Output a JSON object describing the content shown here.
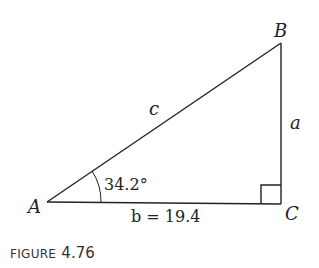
{
  "figure": {
    "vertices": {
      "A": "A",
      "B": "B",
      "C": "C"
    },
    "sides": {
      "hypotenuse": "c",
      "opposite": "a",
      "adjacent_label": "b = 19.4"
    },
    "angle_A": "34.2°",
    "right_angle_at": "C",
    "line_color": "#222222"
  },
  "caption": {
    "word": "FIGURE",
    "number": "4.76"
  }
}
